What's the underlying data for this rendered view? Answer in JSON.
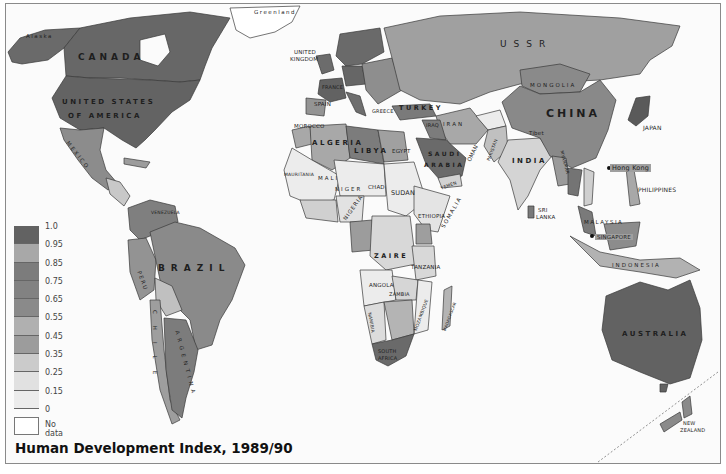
{
  "map": {
    "title": "Human Development Index, 1989/90",
    "type": "choropleth",
    "colors": {
      "very_high": "#626262",
      "high_light": "#a5a5a5",
      "high": "#7f7f7f",
      "upper_mid": "#8a8a8a",
      "mid": "#9a9a9a",
      "lower_mid": "#b2b2b2",
      "low": "#cfcfcf",
      "very_low": "#e4e4e4",
      "lowest": "#eeeeee",
      "no_data": "#ffffff",
      "border": "#333333",
      "ocean": "#fbfbfb"
    },
    "legend": {
      "labels": [
        "1.0",
        "0.95",
        "0.85",
        "0.75",
        "0.65",
        "0.55",
        "0.45",
        "0.35",
        "0.25",
        "0.15",
        "0"
      ],
      "swatches": [
        "#626262",
        "#a8a8a8",
        "#7c7c7c",
        "#828282",
        "#8a8a8a",
        "#b0b0b0",
        "#9c9c9c",
        "#cbcbcb",
        "#e1e1e1",
        "#ececec"
      ],
      "no_data_label": "No data"
    },
    "labels": {
      "alaska": "Alaska",
      "greenland": "Greenland",
      "canada": "CANADA",
      "usa_1": "UNITED STATES",
      "usa_2": "OF AMERICA",
      "mexico": "MEXICO",
      "venezuela": "VENEZUELA",
      "brazil": "BRAZIL",
      "peru": "PERU",
      "chile": "CHILE",
      "argentina": "ARGENTINA",
      "uk_1": "UNITED",
      "uk_2": "KINGDOM",
      "france": "FRANCE",
      "spain": "SPAIN",
      "greece": "GREECE",
      "turkey": "TURKEY",
      "ussr": "USSR",
      "morocco": "MOROCCO",
      "algeria": "ALGERIA",
      "libya": "LIBYA",
      "egypt": "EGYPT",
      "iraq": "IRAQ",
      "iran": "IRAN",
      "saudi_1": "SAUDI",
      "saudi_2": "ARABIA",
      "oman": "OMAN",
      "yemen": "YEMEN",
      "pakistan": "PAKISTAN",
      "india": "INDIA",
      "sri_lanka_1": "SRI",
      "sri_lanka_2": "LANKA",
      "mongolia": "MONGOLIA",
      "china": "CHINA",
      "tibet": "Tibet",
      "japan": "JAPAN",
      "myanmar": "MYANMAR",
      "hong_kong": "Hong Kong",
      "philippines": "PHILIPPINES",
      "malaysia": "MALAYSIA",
      "singapore": "SINGAPORE",
      "indonesia": "INDONESIA",
      "australia": "AUSTRALIA",
      "new_zealand_1": "NEW",
      "new_zealand_2": "ZEALAND",
      "mauritania": "MAURITANIA",
      "mali": "MALI",
      "niger": "NIGER",
      "chad": "CHAD",
      "sudan": "SUDAN",
      "nigeria": "NIGERIA",
      "ethiopia": "ETHIOPIA",
      "somalia": "SOMALIA",
      "zaire": "ZAIRE",
      "tanzania": "TANZANIA",
      "angola": "ANGOLA",
      "zambia": "ZAMBIA",
      "namibia": "NAMIBIA",
      "mozambique": "MOZAMBIQUE",
      "madagascar": "MADAGASCAR",
      "south_africa_1": "SOUTH",
      "south_africa_2": "AFRICA"
    }
  }
}
